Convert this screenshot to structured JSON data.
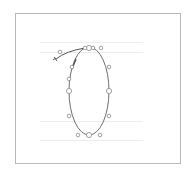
{
  "editor": {
    "glyph_name": "zero",
    "frame": {
      "x": 15,
      "y": 13,
      "width": 165,
      "height": 150,
      "color": "#b8b8b8"
    },
    "guides": [
      {
        "name": "ascender",
        "y": 42,
        "x1": 40,
        "x2": 143
      },
      {
        "name": "cap-height",
        "y": 52,
        "x1": 40,
        "x2": 143
      },
      {
        "name": "baseline",
        "y": 121,
        "x1": 40,
        "x2": 143
      },
      {
        "name": "descender",
        "y": 140,
        "x1": 40,
        "x2": 143
      }
    ],
    "colors": {
      "guide": "#ececec",
      "outline": "#6e6e6e",
      "point": "#8a8a8a",
      "stroke": "#555555"
    },
    "contour": {
      "cx": 89,
      "cy": 91,
      "rx": 20,
      "ry": 44
    },
    "points": [
      {
        "x": 89,
        "y": 48,
        "type": "on-curve"
      },
      {
        "x": 85,
        "y": 48,
        "type": "handle"
      },
      {
        "x": 93,
        "y": 48,
        "type": "handle"
      },
      {
        "x": 101,
        "y": 48,
        "type": "handle"
      },
      {
        "x": 109,
        "y": 67,
        "type": "handle"
      },
      {
        "x": 109,
        "y": 91,
        "type": "on-curve"
      },
      {
        "x": 109,
        "y": 116,
        "type": "handle"
      },
      {
        "x": 100,
        "y": 135,
        "type": "handle"
      },
      {
        "x": 89,
        "y": 135,
        "type": "on-curve"
      },
      {
        "x": 78,
        "y": 135,
        "type": "handle"
      },
      {
        "x": 69,
        "y": 116,
        "type": "handle"
      },
      {
        "x": 69,
        "y": 91,
        "type": "on-curve"
      },
      {
        "x": 69,
        "y": 79,
        "type": "handle"
      },
      {
        "x": 72,
        "y": 67,
        "type": "handle"
      },
      {
        "x": 60,
        "y": 52,
        "type": "handle"
      }
    ],
    "open_path": {
      "d": "M56 59 Q66 51 85 48"
    },
    "pen_mark": {
      "d": "M72 69 L76 59"
    }
  }
}
